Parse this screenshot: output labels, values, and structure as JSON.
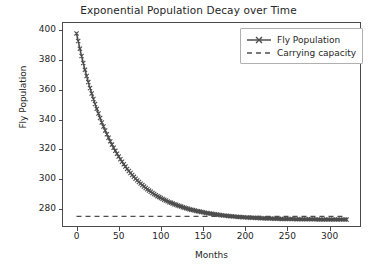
{
  "chart_data": {
    "type": "line",
    "title": "Exponential Population Decay over Time",
    "xlabel": "Months",
    "ylabel": "Fly Population",
    "xlim": [
      -16,
      336
    ],
    "ylim": [
      268.5,
      405
    ],
    "xticks": [
      0,
      50,
      100,
      150,
      200,
      250,
      300
    ],
    "xtick_labels": [
      "0",
      "50",
      "100",
      "150",
      "200",
      "250",
      "300"
    ],
    "yticks": [
      280,
      300,
      320,
      340,
      360,
      380,
      400
    ],
    "ytick_labels": [
      "280",
      "300",
      "320",
      "340",
      "360",
      "380",
      "400"
    ],
    "grid": false,
    "legend_position": "upper right",
    "line_color": "#4d4d4d",
    "series": [
      {
        "name": "Fly Population",
        "style": "solid-with-x-markers",
        "marker": "x",
        "color": "#4d4d4d",
        "model": "y = 275 + 123 * exp(-t / 45)",
        "x": [
          0,
          5,
          10,
          15,
          20,
          25,
          30,
          35,
          40,
          45,
          50,
          55,
          60,
          65,
          70,
          75,
          80,
          85,
          90,
          95,
          100,
          110,
          120,
          130,
          140,
          150,
          160,
          170,
          180,
          190,
          200,
          210,
          220,
          230,
          240,
          250,
          260,
          270,
          280,
          290,
          300,
          310,
          320
        ],
        "values": [
          398.0,
          385.1,
          373.5,
          363.2,
          353.9,
          345.6,
          338.1,
          331.4,
          325.4,
          320.0,
          315.2,
          310.8,
          306.9,
          303.4,
          300.3,
          297.5,
          295.0,
          292.7,
          290.7,
          288.9,
          287.3,
          284.5,
          282.3,
          280.4,
          278.9,
          277.7,
          276.7,
          275.9,
          275.2,
          274.7,
          274.3,
          274.0,
          273.7,
          273.5,
          273.3,
          273.2,
          273.1,
          273.0,
          273.0,
          272.9,
          272.9,
          272.8,
          272.8
        ]
      },
      {
        "name": "Carrying capacity",
        "style": "dashed",
        "color": "#4d4d4d",
        "constant_value": 275,
        "values": [
          275,
          275
        ]
      }
    ]
  },
  "legend": {
    "items": [
      {
        "label": "Fly Population"
      },
      {
        "label": "Carrying capacity"
      }
    ]
  }
}
